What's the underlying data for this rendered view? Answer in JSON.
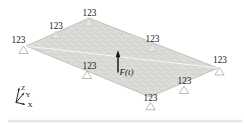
{
  "figure": {
    "background_color": "#ffffff",
    "plate": {
      "fill_color": "#dcdcd8",
      "speckle_color": "#b2b2ae",
      "edge_color": "#a9a9a5"
    },
    "supports": [
      {
        "position": "left-corner",
        "label": "123"
      },
      {
        "position": "top-left-edge",
        "label": "123"
      },
      {
        "position": "top-corner",
        "label": "123"
      },
      {
        "position": "top-right-edge",
        "label": "123"
      },
      {
        "position": "right-corner",
        "label": "123"
      },
      {
        "position": "bottom-right-edge",
        "label": "123"
      },
      {
        "position": "bottom-corner",
        "label": "123"
      },
      {
        "position": "bottom-left-edge",
        "label": "123"
      }
    ],
    "force": {
      "label": "F(t)",
      "direction": "up",
      "color": "#111111"
    },
    "triad": {
      "z_label": "Z",
      "y_label": "Y",
      "x_label": "X"
    }
  }
}
